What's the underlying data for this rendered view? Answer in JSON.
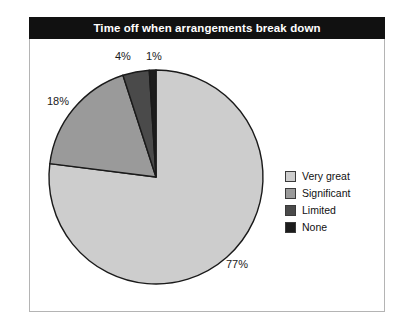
{
  "title": "Time off when arrangements break down",
  "chart_data": {
    "type": "pie",
    "title": "Time off when arrangements break down",
    "categories": [
      "Very great",
      "Significant",
      "Limited",
      "None"
    ],
    "values": [
      77,
      18,
      4,
      1
    ],
    "value_labels": [
      "77%",
      "18%",
      "4%",
      "1%"
    ],
    "units": "percent",
    "colors": [
      "#cdcdcd",
      "#9a9a9a",
      "#4a4a4a",
      "#1c1c1c"
    ],
    "start_angle_deg": 0,
    "direction": "clockwise",
    "legend_position": "right",
    "grid": false,
    "xlabel": "",
    "ylabel": ""
  },
  "slices": [
    {
      "label": "Very great",
      "pct_text": "77%",
      "color": "#cdcdcd"
    },
    {
      "label": "Significant",
      "pct_text": "18%",
      "color": "#9a9a9a"
    },
    {
      "label": "Limited",
      "pct_text": "4%",
      "color": "#4a4a4a"
    },
    {
      "label": "None",
      "pct_text": "1%",
      "color": "#1c1c1c"
    }
  ],
  "legend": {
    "items": [
      {
        "label": "Very great",
        "color": "#cdcdcd"
      },
      {
        "label": "Significant",
        "color": "#9a9a9a"
      },
      {
        "label": "Limited",
        "color": "#4a4a4a"
      },
      {
        "label": "None",
        "color": "#1c1c1c"
      }
    ]
  }
}
